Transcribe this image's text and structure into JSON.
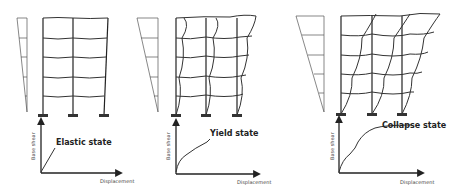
{
  "panels": [
    {
      "state_label": "Elastic state",
      "y_axis_label": "Base shear",
      "x_axis_label": "Displacement"
    },
    {
      "state_label": "Yield state",
      "y_axis_label": "Base shear",
      "x_axis_label": "Displacement"
    },
    {
      "state_label": "Collapse state",
      "y_axis_label": "Base shear",
      "x_axis_label": "Displacement"
    }
  ],
  "colors": {
    "line": "#333333",
    "background": "#ffffff"
  }
}
